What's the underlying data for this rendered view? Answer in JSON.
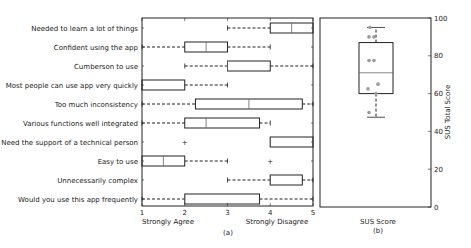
{
  "chart_data": [
    {
      "type": "box",
      "orientation": "horizontal",
      "caption": "(a)",
      "xlim": [
        1,
        5
      ],
      "xticks": [
        1,
        2,
        3,
        4,
        5
      ],
      "xlabel_left": "Strongly Agree",
      "xlabel_right": "Strongly Disagree",
      "grid": false,
      "categories": [
        "Needed to learn a lot of things",
        "Confident using the app",
        "Cumberson to use",
        "Most people can use app very quickly",
        "Too much inconsistency",
        "Various functions well integrated",
        "Need the support of a technical person",
        "Easy to use",
        "Unnecessarily complex",
        "Would you use this app frequently"
      ],
      "boxes": [
        {
          "whislo": 3,
          "q1": 4,
          "med": 4.5,
          "q3": 5,
          "whishi": 5,
          "fliers": []
        },
        {
          "whislo": 1,
          "q1": 2,
          "med": 2.5,
          "q3": 3,
          "whishi": 4,
          "fliers": []
        },
        {
          "whislo": 2,
          "q1": 3,
          "med": 3,
          "q3": 4,
          "whishi": 5,
          "fliers": []
        },
        {
          "whislo": 1,
          "q1": 1,
          "med": 1,
          "q3": 2,
          "whishi": 3,
          "fliers": []
        },
        {
          "whislo": 1,
          "q1": 2.25,
          "med": 3.5,
          "q3": 4.75,
          "whishi": 5,
          "fliers": []
        },
        {
          "whislo": 1,
          "q1": 2,
          "med": 2.5,
          "q3": 3.75,
          "whishi": 4,
          "fliers": []
        },
        {
          "whislo": 4,
          "q1": 4,
          "med": 4,
          "q3": 5,
          "whishi": 5,
          "fliers": [
            2
          ]
        },
        {
          "whislo": 1,
          "q1": 1,
          "med": 1.5,
          "q3": 2,
          "whishi": 3,
          "fliers": [
            4
          ]
        },
        {
          "whislo": 3,
          "q1": 4,
          "med": 4,
          "q3": 4.75,
          "whishi": 5,
          "fliers": []
        },
        {
          "whislo": 1,
          "q1": 2,
          "med": 2,
          "q3": 3.75,
          "whishi": 5,
          "fliers": []
        }
      ]
    },
    {
      "type": "box",
      "orientation": "vertical",
      "caption": "(b)",
      "xlabel": "SUS Score",
      "ylabel": "SUS Total Score",
      "ylim": [
        0,
        100
      ],
      "yticks": [
        0,
        20,
        40,
        60,
        80,
        100
      ],
      "y_axis_side": "right",
      "box": {
        "whislo": 47.5,
        "q1": 60,
        "med": 71,
        "q3": 87,
        "whishi": 95
      },
      "points": [
        95,
        90,
        90,
        77.5,
        77.5,
        65,
        62.5,
        60,
        50
      ]
    }
  ],
  "colors": {
    "line": "#222222",
    "points": "#9a9a9a"
  }
}
